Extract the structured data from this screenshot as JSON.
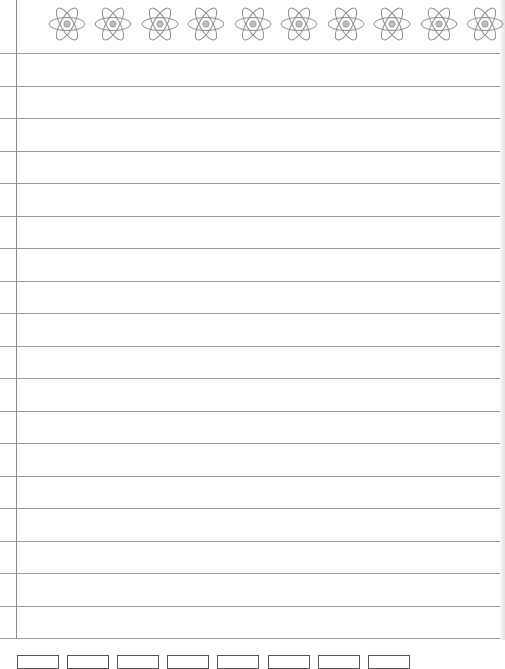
{
  "page": {
    "type": "lined notebook paper",
    "header_icon": "atom-icon",
    "header_icon_count": 10,
    "colors": {
      "rule": "#9a9a9a",
      "margin": "#8a8a8a",
      "atom_stroke": "#8c8c8c",
      "nucleus": "#bdbdbd"
    }
  },
  "atoms": [
    {
      "cx": 67
    },
    {
      "cx": 113
    },
    {
      "cx": 160
    },
    {
      "cx": 206
    },
    {
      "cx": 253
    },
    {
      "cx": 299
    },
    {
      "cx": 346
    },
    {
      "cx": 392
    },
    {
      "cx": 439
    },
    {
      "cx": 485
    }
  ],
  "rules": [
    53,
    85.5,
    118,
    150.5,
    183,
    215.5,
    248,
    280.5,
    313,
    345.5,
    378,
    410.5,
    443,
    475.5,
    508,
    540.5,
    573,
    605.5,
    638
  ],
  "bottom_buttons": [
    {
      "x": 17,
      "label": ""
    },
    {
      "x": 67,
      "label": ""
    },
    {
      "x": 117,
      "label": ""
    },
    {
      "x": 167,
      "label": ""
    },
    {
      "x": 217,
      "label": ""
    },
    {
      "x": 268,
      "label": ""
    },
    {
      "x": 318,
      "label": ""
    },
    {
      "x": 368,
      "label": ""
    }
  ]
}
